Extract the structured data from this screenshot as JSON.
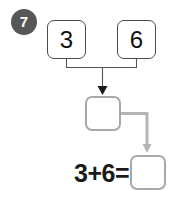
{
  "worksheet": {
    "problem_number": "7",
    "badge_color": "#575757",
    "background_color": "#ffffff"
  },
  "addends": [
    {
      "name": "first-addend",
      "value": "3"
    },
    {
      "name": "second-addend",
      "value": "6"
    }
  ],
  "sum_box": {
    "label": "sum-answer-box",
    "value": "",
    "border_color": "#a8a8a8"
  },
  "answer_box": {
    "label": "equation-answer-box",
    "value": "",
    "border_color": "#a8a8a8"
  },
  "equation": {
    "text": "3+6=",
    "first_operand": "3",
    "operator": "+",
    "second_operand": "6",
    "equals": "=",
    "result": ""
  },
  "connectors": {
    "bracket_color": "#555555",
    "arrow_color": "#1a1a1a",
    "transfer_color": "#b5b5b5"
  }
}
